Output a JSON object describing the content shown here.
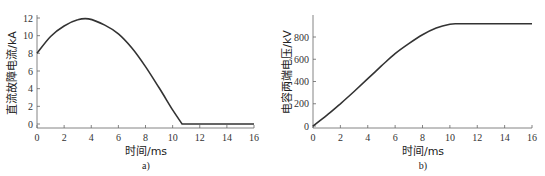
{
  "chart_data": [
    {
      "type": "line",
      "panel": "a)",
      "title": "",
      "xlabel": "时间/ms",
      "ylabel": "直流故障电流/kA",
      "xlim": [
        0,
        16
      ],
      "ylim": [
        0,
        12
      ],
      "xticks": [
        0,
        2,
        4,
        6,
        8,
        10,
        12,
        14,
        16
      ],
      "yticks": [
        0,
        2,
        4,
        6,
        8,
        10,
        12
      ],
      "grid": false,
      "series": [
        {
          "name": "直流故障电流",
          "x": [
            0,
            1,
            2,
            3,
            3.8,
            5,
            6,
            7,
            8,
            9,
            10,
            10.7,
            12,
            14,
            16
          ],
          "y": [
            8,
            9.9,
            11.1,
            11.8,
            11.9,
            11.2,
            10.2,
            8.6,
            6.5,
            4.1,
            1.6,
            0,
            0,
            0,
            0
          ]
        }
      ]
    },
    {
      "type": "line",
      "panel": "b)",
      "title": "",
      "xlabel": "时间/ms",
      "ylabel": "电容两端电压/kV",
      "xlim": [
        0,
        16
      ],
      "ylim": [
        0,
        950
      ],
      "xticks": [
        0,
        2,
        4,
        6,
        8,
        10,
        12,
        14,
        16
      ],
      "yticks": [
        0,
        200,
        400,
        600,
        800
      ],
      "grid": false,
      "series": [
        {
          "name": "电容两端电压",
          "x": [
            0,
            1,
            2,
            3,
            4,
            5,
            6,
            7,
            8,
            9,
            10,
            10.5,
            12,
            14,
            16
          ],
          "y": [
            0,
            95,
            200,
            310,
            425,
            540,
            650,
            740,
            820,
            880,
            915,
            920,
            920,
            920,
            920
          ]
        }
      ]
    }
  ],
  "panels": {
    "a": {
      "caption": "a)",
      "xlabel": "时间/ms",
      "ylabel": "直流故障电流/kA"
    },
    "b": {
      "caption": "b)",
      "xlabel": "时间/ms",
      "ylabel": "电容两端电压/kV"
    }
  }
}
